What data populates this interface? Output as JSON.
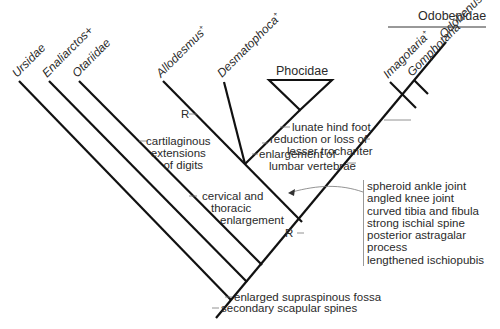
{
  "diagram": {
    "type": "cladogram",
    "taxa": [
      {
        "name": "Ursidae",
        "suffix": ""
      },
      {
        "name": "Enaliarctos",
        "suffix": "+"
      },
      {
        "name": "Otariidae",
        "suffix": ""
      },
      {
        "name": "Allodesmus",
        "suffix": "+"
      },
      {
        "name": "Desmatophoca",
        "suffix": "+"
      },
      {
        "name": "Imagotaria",
        "suffix": "+"
      },
      {
        "name": "Gomphotaria",
        "suffix": "+"
      },
      {
        "name": "Odobenus",
        "suffix": ""
      }
    ],
    "groups": {
      "phocidae": "Phocidae",
      "odobenidae": "Odobenidae"
    },
    "characters": {
      "root_1": "enlarged supraspinous fossa",
      "root_2": "secondary scapular spines",
      "cartilaginous": [
        "cartilaginous",
        "extensions",
        "of digits"
      ],
      "cervical": [
        "cervical and",
        "thoracic",
        "enlargement"
      ],
      "lumbar": [
        "enlargement of",
        "lumbar vertebrae"
      ],
      "trochanter": [
        "reduction or loss of",
        "lesser trochanter"
      ],
      "lunate": "lunate hind foot",
      "r_upper": "R",
      "r_lower": "R",
      "box_list": [
        "spheroid ankle joint",
        "angled knee joint",
        "curved tibia and fibula",
        "strong ischial spine",
        "posterior astragalar process",
        "lengthened ischiopubis"
      ]
    }
  }
}
